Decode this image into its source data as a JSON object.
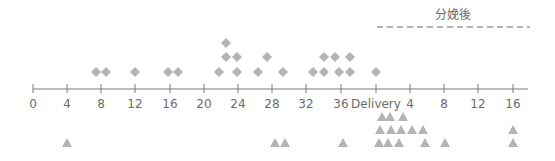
{
  "chart_data": {
    "type": "scatter",
    "title": "",
    "header": {
      "label": "分娩後",
      "x_start_px": 377,
      "x_end_px": 530
    },
    "colors": {
      "marker": "#b4b4b4",
      "axis": "#7a7a7a",
      "text": "#6b6b6b",
      "dash": "#b4b4b4"
    },
    "axis": {
      "y_px": 89,
      "x_start_px": 33,
      "x_end_px": 528,
      "ticks": [
        {
          "label": "0",
          "x": 33
        },
        {
          "label": "4",
          "x": 67
        },
        {
          "label": "8",
          "x": 101
        },
        {
          "label": "12",
          "x": 135
        },
        {
          "label": "16",
          "x": 170
        },
        {
          "label": "20",
          "x": 204
        },
        {
          "label": "24",
          "x": 238
        },
        {
          "label": "28",
          "x": 272
        },
        {
          "label": "32",
          "x": 306
        },
        {
          "label": "36",
          "x": 341
        },
        {
          "label": "Delivery",
          "x": 376
        },
        {
          "label": "4",
          "x": 410
        },
        {
          "label": "8",
          "x": 444
        },
        {
          "label": "12",
          "x": 478
        },
        {
          "label": "16",
          "x": 513
        }
      ]
    },
    "series": [
      {
        "name": "pregnancy (weeks)",
        "marker": "diamond",
        "points_weeks_stacked": [
          {
            "week": 7.5,
            "stack": 1
          },
          {
            "week": 8.6,
            "stack": 1
          },
          {
            "week": 12.0,
            "stack": 1
          },
          {
            "week": 15.9,
            "stack": 1
          },
          {
            "week": 17.0,
            "stack": 1
          },
          {
            "week": 21.7,
            "stack": 1
          },
          {
            "week": 22.5,
            "stack": 2
          },
          {
            "week": 22.5,
            "stack": 3
          },
          {
            "week": 23.8,
            "stack": 1
          },
          {
            "week": 23.8,
            "stack": 2
          },
          {
            "week": 26.2,
            "stack": 1
          },
          {
            "week": 27.5,
            "stack": 2
          },
          {
            "week": 29.1,
            "stack": 1
          },
          {
            "week": 32.6,
            "stack": 1
          },
          {
            "week": 33.9,
            "stack": 1
          },
          {
            "week": 33.9,
            "stack": 2
          },
          {
            "week": 35.1,
            "stack": 2
          },
          {
            "week": 35.6,
            "stack": 1
          },
          {
            "week": 36.9,
            "stack": 1
          },
          {
            "week": 36.9,
            "stack": 2
          },
          {
            "week": 40.1,
            "stack": 1
          }
        ],
        "points_px": [
          [
            96,
            72
          ],
          [
            106,
            72
          ],
          [
            135,
            72
          ],
          [
            168,
            72
          ],
          [
            178,
            72
          ],
          [
            219,
            72
          ],
          [
            237,
            72
          ],
          [
            258,
            72
          ],
          [
            283,
            72
          ],
          [
            313,
            72
          ],
          [
            324,
            72
          ],
          [
            339,
            72
          ],
          [
            350,
            72
          ],
          [
            376,
            72
          ],
          [
            226,
            57
          ],
          [
            237,
            57
          ],
          [
            267,
            57
          ],
          [
            324,
            57
          ],
          [
            335,
            57
          ],
          [
            350,
            57
          ],
          [
            226,
            43
          ]
        ]
      },
      {
        "name": "postpartum (weeks)",
        "marker": "triangle",
        "points_px": [
          [
            382,
            117
          ],
          [
            390,
            117
          ],
          [
            403,
            117
          ],
          [
            380,
            130
          ],
          [
            391,
            130
          ],
          [
            401,
            130
          ],
          [
            412,
            130
          ],
          [
            423,
            130
          ],
          [
            513,
            130
          ],
          [
            67,
            143
          ],
          [
            275,
            143
          ],
          [
            285,
            143
          ],
          [
            343,
            143
          ],
          [
            379,
            143
          ],
          [
            388,
            143
          ],
          [
            399,
            143
          ],
          [
            425,
            143
          ],
          [
            445,
            143
          ],
          [
            513,
            143
          ]
        ]
      }
    ],
    "xlabel": "",
    "ylabel": "",
    "grid": false,
    "legend": "none"
  }
}
